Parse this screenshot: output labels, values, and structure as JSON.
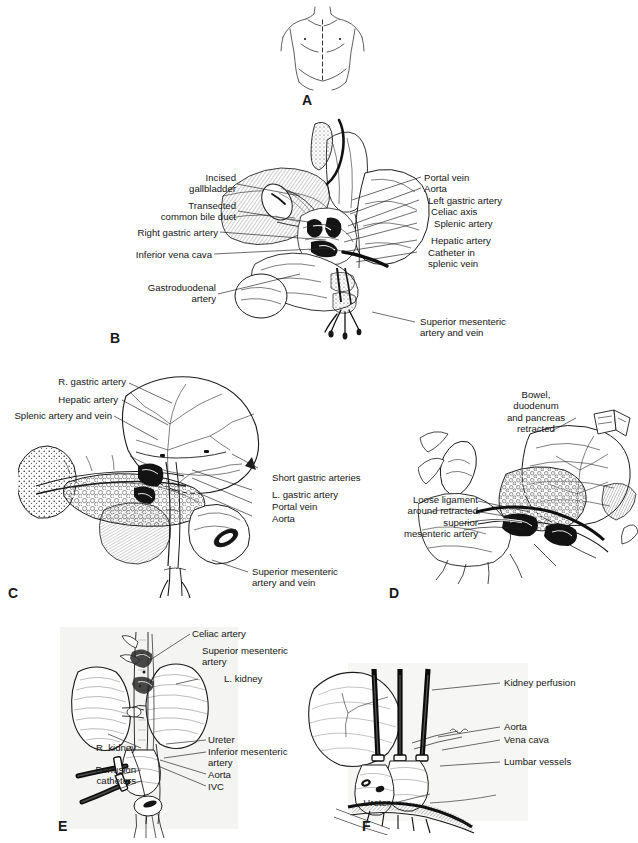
{
  "figure": {
    "width": 638,
    "height": 843,
    "background_color": "#ffffff",
    "ink_color": "#1b1b1b"
  },
  "panels": [
    {
      "id": "A",
      "letter": "A",
      "caption": "Torso with midline incision",
      "labels": []
    },
    {
      "id": "B",
      "letter": "B",
      "caption": "Upper abdominal dissection, celiac axis exposure",
      "labels": [
        {
          "id": "b-incised-gallbladder",
          "text": "Incised\ngallbladder"
        },
        {
          "id": "b-transected-cbd",
          "text": "Transected\ncommon bile duct"
        },
        {
          "id": "b-right-gastric-artery",
          "text": "Right gastric artery"
        },
        {
          "id": "b-inferior-vena-cava",
          "text": "Inferior vena cava"
        },
        {
          "id": "b-gastroduodenal-artery",
          "text": "Gastroduodenal\nartery"
        },
        {
          "id": "b-portal-vein",
          "text": "Portal vein"
        },
        {
          "id": "b-aorta",
          "text": "Aorta"
        },
        {
          "id": "b-left-gastric-artery",
          "text": "Left gastric artery"
        },
        {
          "id": "b-celiac-axis",
          "text": "Celiac axis"
        },
        {
          "id": "b-splenic-artery",
          "text": "Splenic artery"
        },
        {
          "id": "b-hepatic-artery",
          "text": "Hepatic artery"
        },
        {
          "id": "b-catheter-splenic-vein",
          "text": "Catheter in\nsplenic vein"
        },
        {
          "id": "b-superior-mesenteric",
          "text": "Superior mesenteric\nartery and vein"
        }
      ]
    },
    {
      "id": "C",
      "letter": "C",
      "caption": "Pancreas, spleen and stomach with vascular pedicles",
      "labels": [
        {
          "id": "c-r-gastric-artery",
          "text": "R. gastric artery"
        },
        {
          "id": "c-hepatic-artery",
          "text": "Hepatic artery"
        },
        {
          "id": "c-splenic-artery-vein",
          "text": "Splenic artery and vein"
        },
        {
          "id": "c-short-gastric-arteries",
          "text": "Short gastric arteries"
        },
        {
          "id": "c-l-gastric-artery",
          "text": "L. gastric artery"
        },
        {
          "id": "c-portal-vein",
          "text": "Portal vein"
        },
        {
          "id": "c-aorta",
          "text": "Aorta"
        },
        {
          "id": "c-superior-mesenteric",
          "text": "Superior mesenteric\nartery and vein"
        }
      ]
    },
    {
      "id": "D",
      "letter": "D",
      "caption": "Retracted viscera exposing superior mesenteric artery",
      "labels": [
        {
          "id": "d-bowel-retracted",
          "text": "Bowel,\nduodenum\nand pancreas\nretracted"
        },
        {
          "id": "d-loose-ligament",
          "text": "Loose ligament\naround retracted\nsuperior\nmesenteric artery"
        }
      ]
    },
    {
      "id": "E",
      "letter": "E",
      "caption": "En bloc kidneys with aorta, IVC and perfusion catheters",
      "labels": [
        {
          "id": "e-celiac-artery",
          "text": "Celiac artery"
        },
        {
          "id": "e-superior-mesenteric-artery",
          "text": "Superior mesenteric\nartery"
        },
        {
          "id": "e-l-kidney",
          "text": "L. kidney"
        },
        {
          "id": "e-r-kidney",
          "text": "R. kidney"
        },
        {
          "id": "e-perfusion-catheters",
          "text": "Perfusion\ncatheters"
        },
        {
          "id": "e-ureter",
          "text": "Ureter"
        },
        {
          "id": "e-inferior-mesenteric-artery",
          "text": "Inferior mesenteric\nartery"
        },
        {
          "id": "e-aorta",
          "text": "Aorta"
        },
        {
          "id": "e-ivc",
          "text": "IVC"
        }
      ]
    },
    {
      "id": "F",
      "letter": "F",
      "caption": "Kidney perfusion with cannulated aorta and vena cava",
      "labels": [
        {
          "id": "f-kidney-perfusion",
          "text": "Kidney perfusion"
        },
        {
          "id": "f-aorta",
          "text": "Aorta"
        },
        {
          "id": "f-vena-cava",
          "text": "Vena cava"
        },
        {
          "id": "f-lumbar-vessels",
          "text": "Lumbar vessels"
        },
        {
          "id": "f-ureter",
          "text": "Ureter"
        }
      ]
    }
  ]
}
